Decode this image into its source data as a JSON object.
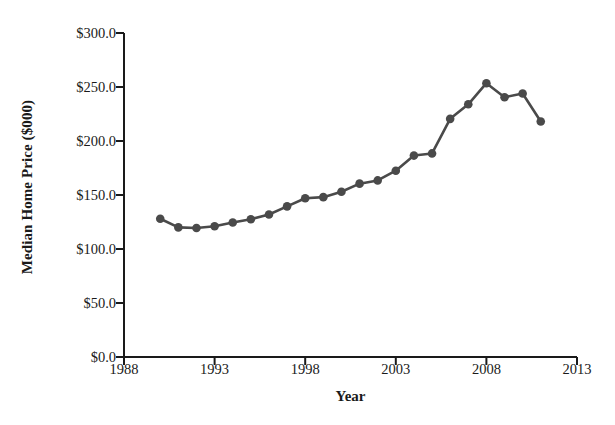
{
  "chart_data": {
    "type": "line",
    "title": "",
    "xlabel": "Year",
    "ylabel": "Median Home Price ($000)",
    "xlim": [
      1988,
      2013
    ],
    "ylim": [
      0,
      300
    ],
    "grid": false,
    "legend": null,
    "xticks": [
      "1988",
      "1993",
      "1998",
      "2003",
      "2008",
      "2013"
    ],
    "xtick_values": [
      1988,
      1993,
      1998,
      2003,
      2008,
      2013
    ],
    "yticks": [
      "$0.0",
      "$50.0",
      "$100.0",
      "$150.0",
      "$200.0",
      "$250.0",
      "$300.0"
    ],
    "ytick_values": [
      0,
      50,
      100,
      150,
      200,
      250,
      300
    ],
    "marker": "circle",
    "series_color": "#4a4a4a",
    "x": [
      1990,
      1991,
      1992,
      1993,
      1994,
      1995,
      1996,
      1997,
      1998,
      1999,
      2000,
      2001,
      2002,
      2003,
      2004,
      2005,
      2006,
      2007,
      2008,
      2009,
      2010,
      2011
    ],
    "values": [
      128.0,
      120.0,
      119.5,
      121.0,
      124.5,
      127.5,
      132.0,
      139.5,
      147.0,
      148.0,
      153.0,
      160.5,
      163.5,
      172.5,
      186.5,
      188.5,
      220.5,
      234.0,
      253.5,
      240.5,
      244.0,
      218.0
    ],
    "series": [
      {
        "name": "Median Home Price",
        "points": [
          {
            "year": 1990,
            "value": 128.0
          },
          {
            "year": 1991,
            "value": 120.0
          },
          {
            "year": 1992,
            "value": 119.5
          },
          {
            "year": 1993,
            "value": 121.0
          },
          {
            "year": 1994,
            "value": 124.5
          },
          {
            "year": 1995,
            "value": 127.5
          },
          {
            "year": 1996,
            "value": 132.0
          },
          {
            "year": 1997,
            "value": 139.5
          },
          {
            "year": 1998,
            "value": 147.0
          },
          {
            "year": 1999,
            "value": 148.0
          },
          {
            "year": 2000,
            "value": 153.0
          },
          {
            "year": 2001,
            "value": 160.5
          },
          {
            "year": 2002,
            "value": 163.5
          },
          {
            "year": 2003,
            "value": 172.5
          },
          {
            "year": 2004,
            "value": 186.5
          },
          {
            "year": 2005,
            "value": 188.5
          },
          {
            "year": 2006,
            "value": 220.5
          },
          {
            "year": 2007,
            "value": 234.0
          },
          {
            "year": 2008,
            "value": 253.5
          },
          {
            "year": 2009,
            "value": 240.5
          },
          {
            "year": 2010,
            "value": 244.0
          },
          {
            "year": 2011,
            "value": 218.0
          }
        ]
      }
    ]
  },
  "axes": {
    "y_title": "Median Home Price ($000)",
    "x_title": "Year"
  }
}
